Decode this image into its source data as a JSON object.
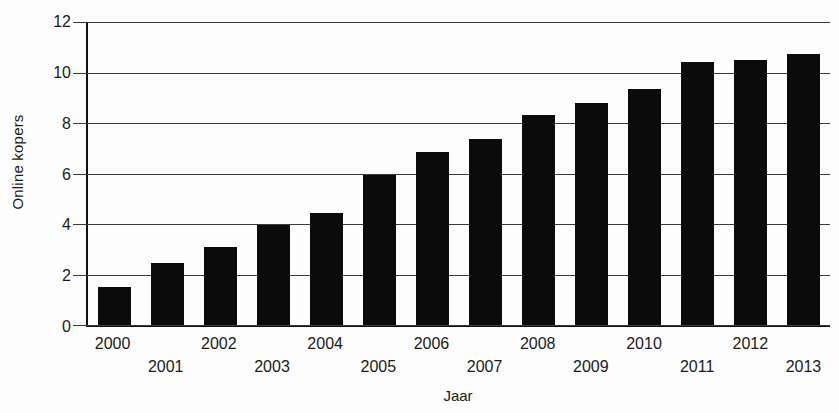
{
  "chart_data": {
    "type": "bar",
    "title": "",
    "xlabel": "Jaar",
    "ylabel": "Online kopers",
    "categories": [
      "2000",
      "2001",
      "2002",
      "2003",
      "2004",
      "2005",
      "2006",
      "2007",
      "2008",
      "2009",
      "2010",
      "2011",
      "2012",
      "2013"
    ],
    "values": [
      1.5,
      2.45,
      3.1,
      3.95,
      4.45,
      5.95,
      6.85,
      7.35,
      8.3,
      8.8,
      9.35,
      10.4,
      10.5,
      10.75
    ],
    "ylim": [
      0,
      12
    ],
    "yticks": [
      0,
      2,
      4,
      6,
      8,
      10,
      12
    ],
    "grid": "horizontal",
    "legend": "none",
    "bar_color": "#0b0b0b",
    "gridline_color": "#3a3a3a",
    "axis_color": "#111111",
    "x_labels_staggered": true
  }
}
